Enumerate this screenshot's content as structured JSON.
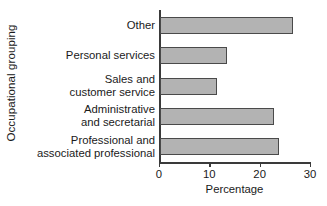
{
  "chart_data": {
    "type": "bar",
    "orientation": "horizontal",
    "title": "",
    "xlabel": "Percentage",
    "ylabel": "Occupational grouping",
    "categories": [
      "Professional and\nassociated professional",
      "Administrative\nand secretarial",
      "Sales and\ncustomer service",
      "Personal services",
      "Other"
    ],
    "values": [
      23.6,
      22.6,
      11.4,
      13.4,
      26.4
    ],
    "xlim": [
      0,
      30
    ],
    "xticks": [
      0,
      10,
      20,
      30
    ],
    "xtick_labels": [
      "0",
      "10",
      "20",
      "30"
    ],
    "grid": false,
    "legend": false,
    "bar_fill_color": "#b3b3b3",
    "bar_edge_color": "#4a4a4a",
    "axis_color": "#3a3a3a",
    "background_color": "#ffffff"
  },
  "axes": {
    "y_title": "Occupational grouping",
    "x_title": "Percentage"
  }
}
